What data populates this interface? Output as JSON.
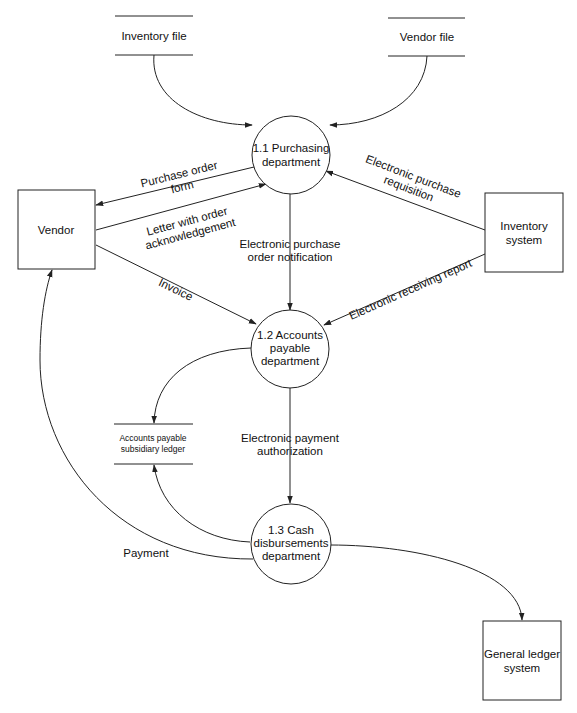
{
  "diagram": {
    "type": "data-flow-diagram",
    "processes": [
      {
        "id": "p1",
        "lines": [
          "1.1 Purchasing",
          "department"
        ]
      },
      {
        "id": "p2",
        "lines": [
          "1.2 Accounts",
          "payable",
          "department"
        ]
      },
      {
        "id": "p3",
        "lines": [
          "1.3 Cash",
          "disbursements",
          "department"
        ]
      }
    ],
    "entities": [
      {
        "id": "vendor",
        "lines": [
          "Vendor"
        ]
      },
      {
        "id": "inventory_system",
        "lines": [
          "Inventory",
          "system"
        ]
      },
      {
        "id": "general_ledger",
        "lines": [
          "General ledger",
          "system"
        ]
      }
    ],
    "stores": [
      {
        "id": "inventory_file",
        "lines": [
          "Inventory file"
        ]
      },
      {
        "id": "vendor_file",
        "lines": [
          "Vendor file"
        ]
      },
      {
        "id": "ap_ledger",
        "lines": [
          "Accounts payable",
          "subsidiary ledger"
        ]
      }
    ],
    "flows": [
      {
        "from": "inventory_file",
        "to": "p1",
        "lines": []
      },
      {
        "from": "vendor_file",
        "to": "p1",
        "lines": []
      },
      {
        "from": "p1",
        "to": "vendor",
        "lines": [
          "Purchase order",
          "form"
        ]
      },
      {
        "from": "vendor",
        "to": "p1",
        "lines": [
          "Letter with order",
          "acknowledgement"
        ]
      },
      {
        "from": "inventory_system",
        "to": "p1",
        "lines": [
          "Electronic purchase",
          "requisition"
        ]
      },
      {
        "from": "p1",
        "to": "p2",
        "lines": [
          "Electronic purchase",
          "order notification"
        ]
      },
      {
        "from": "vendor",
        "to": "p2",
        "lines": [
          "Invoice"
        ]
      },
      {
        "from": "inventory_system",
        "to": "p2",
        "lines": [
          "Electronic receiving report"
        ]
      },
      {
        "from": "p2",
        "to": "ap_ledger",
        "lines": []
      },
      {
        "from": "p2",
        "to": "p3",
        "lines": [
          "Electronic payment",
          "authorization"
        ]
      },
      {
        "from": "p3",
        "to": "ap_ledger",
        "lines": []
      },
      {
        "from": "p3",
        "to": "vendor",
        "lines": [
          "Payment"
        ]
      },
      {
        "from": "p3",
        "to": "general_ledger",
        "lines": []
      }
    ]
  }
}
